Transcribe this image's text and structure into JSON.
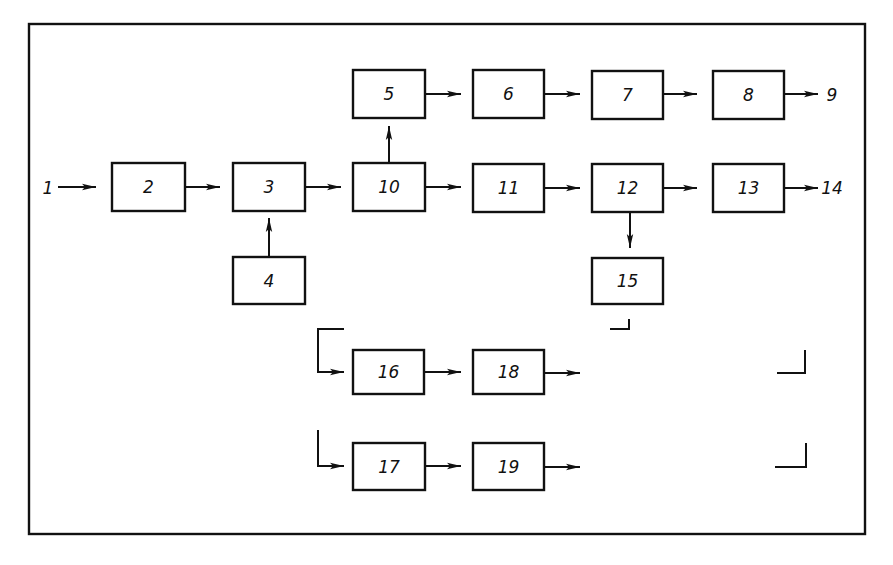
{
  "diagram": {
    "type": "block-diagram",
    "frame": {
      "x": 29,
      "y": 24,
      "w": 836,
      "h": 510
    },
    "colors": {
      "stroke": "#111111",
      "background": "#ffffff"
    },
    "boxes": [
      {
        "id": "2",
        "label": "2",
        "x": 112,
        "y": 163,
        "w": 73,
        "h": 48
      },
      {
        "id": "3",
        "label": "3",
        "x": 233,
        "y": 163,
        "w": 72,
        "h": 48
      },
      {
        "id": "4",
        "label": "4",
        "x": 233,
        "y": 257,
        "w": 72,
        "h": 47
      },
      {
        "id": "10",
        "label": "10",
        "x": 353,
        "y": 163,
        "w": 72,
        "h": 48
      },
      {
        "id": "5",
        "label": "5",
        "x": 353,
        "y": 70,
        "w": 72,
        "h": 48
      },
      {
        "id": "6",
        "label": "6",
        "x": 473,
        "y": 70,
        "w": 71,
        "h": 48
      },
      {
        "id": "7",
        "label": "7",
        "x": 592,
        "y": 71,
        "w": 71,
        "h": 48
      },
      {
        "id": "8",
        "label": "8",
        "x": 713,
        "y": 71,
        "w": 71,
        "h": 48
      },
      {
        "id": "11",
        "label": "11",
        "x": 473,
        "y": 164,
        "w": 71,
        "h": 48
      },
      {
        "id": "12",
        "label": "12",
        "x": 592,
        "y": 164,
        "w": 71,
        "h": 48
      },
      {
        "id": "13",
        "label": "13",
        "x": 713,
        "y": 164,
        "w": 71,
        "h": 48
      },
      {
        "id": "15",
        "label": "15",
        "x": 592,
        "y": 258,
        "w": 71,
        "h": 46
      },
      {
        "id": "16",
        "label": "16",
        "x": 353,
        "y": 350,
        "w": 71,
        "h": 44
      },
      {
        "id": "18",
        "label": "18",
        "x": 473,
        "y": 350,
        "w": 71,
        "h": 44
      },
      {
        "id": "17",
        "label": "17",
        "x": 353,
        "y": 443,
        "w": 72,
        "h": 47
      },
      {
        "id": "19",
        "label": "19",
        "x": 473,
        "y": 443,
        "w": 71,
        "h": 47
      }
    ],
    "terminals": [
      {
        "id": "1",
        "label": "1",
        "x": 48,
        "y": 194
      },
      {
        "id": "9",
        "label": "9",
        "x": 832,
        "y": 101
      },
      {
        "id": "14",
        "label": "14",
        "x": 832,
        "y": 194
      }
    ],
    "connections": [
      {
        "from": "1",
        "to": "2"
      },
      {
        "from": "2",
        "to": "3"
      },
      {
        "from": "4",
        "to": "3"
      },
      {
        "from": "3",
        "to": "10"
      },
      {
        "from": "10",
        "to": "5"
      },
      {
        "from": "5",
        "to": "6"
      },
      {
        "from": "6",
        "to": "7"
      },
      {
        "from": "7",
        "to": "8"
      },
      {
        "from": "8",
        "to": "9"
      },
      {
        "from": "10",
        "to": "11"
      },
      {
        "from": "11",
        "to": "12"
      },
      {
        "from": "12",
        "to": "13"
      },
      {
        "from": "13",
        "to": "14"
      },
      {
        "from": "12",
        "to": "15"
      },
      {
        "from": "branch",
        "to": "16"
      },
      {
        "from": "16",
        "to": "18"
      },
      {
        "from": "18",
        "to": "open"
      },
      {
        "from": "branch",
        "to": "17"
      },
      {
        "from": "17",
        "to": "19"
      },
      {
        "from": "19",
        "to": "open"
      }
    ]
  }
}
